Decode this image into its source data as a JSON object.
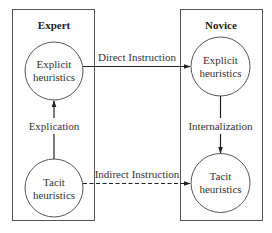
{
  "diagram": {
    "colors": {
      "stroke": "#333333",
      "box_stroke": "#555555",
      "background": "#ffffff"
    },
    "groups": [
      {
        "id": "expert",
        "label": "Expert"
      },
      {
        "id": "novice",
        "label": "Novice"
      }
    ],
    "nodes": {
      "expert_explicit": {
        "line1": "Explicit",
        "line2": "heuristics"
      },
      "expert_tacit": {
        "line1": "Tacit",
        "line2": "heuristics"
      },
      "novice_explicit": {
        "line1": "Explicit",
        "line2": "heuristics"
      },
      "novice_tacit": {
        "line1": "Tacit",
        "line2": "heuristics"
      }
    },
    "edges": {
      "direct": {
        "label": "Direct Instruction",
        "style": "solid",
        "from": "expert_explicit",
        "to": "novice_explicit"
      },
      "indirect": {
        "label": "Indirect Instruction",
        "style": "dashed",
        "from": "expert_tacit",
        "to": "novice_tacit"
      },
      "explication": {
        "label": "Explication",
        "style": "solid",
        "from": "expert_tacit",
        "to": "expert_explicit"
      },
      "internalization": {
        "label": "Internalization",
        "style": "solid",
        "from": "novice_explicit",
        "to": "novice_tacit"
      }
    }
  }
}
